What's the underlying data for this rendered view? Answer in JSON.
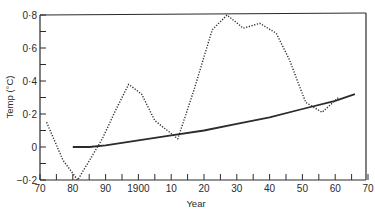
{
  "chart_data": {
    "type": "line",
    "title": "",
    "xlabel": "Year",
    "ylabel": "Temp (°C)",
    "xlim": [
      1870,
      1970
    ],
    "ylim": [
      -0.2,
      0.8
    ],
    "grid": false,
    "legend": null,
    "x_tick_labels": [
      {
        "year": 1870,
        "label": "70"
      },
      {
        "year": 1880,
        "label": "80"
      },
      {
        "year": 1890,
        "label": "90"
      },
      {
        "year": 1900,
        "label": "1900"
      },
      {
        "year": 1910,
        "label": "10"
      },
      {
        "year": 1920,
        "label": "20"
      },
      {
        "year": 1930,
        "label": "30"
      },
      {
        "year": 1940,
        "label": "40"
      },
      {
        "year": 1950,
        "label": "50"
      },
      {
        "year": 1960,
        "label": "60"
      },
      {
        "year": 1970,
        "label": "70"
      }
    ],
    "x_minor_ticks": [
      1875,
      1885,
      1895,
      1905,
      1915,
      1925,
      1935,
      1945,
      1955,
      1965
    ],
    "y_tick_labels": [
      {
        "value": 0.8,
        "label": "0·8"
      },
      {
        "value": 0.6,
        "label": "0·6"
      },
      {
        "value": 0.4,
        "label": "0·4"
      },
      {
        "value": 0.2,
        "label": "0·2"
      },
      {
        "value": 0.0,
        "label": "0"
      },
      {
        "value": -0.2,
        "label": "−0·2"
      }
    ],
    "y_minor_ticks": [
      0.7,
      0.5,
      0.3,
      0.1,
      -0.1
    ],
    "series": [
      {
        "name": "Observed temperature (dotted)",
        "style": "dotted",
        "x": [
          1872,
          1877,
          1881.5,
          1886,
          1889,
          1893,
          1897,
          1901,
          1905,
          1912,
          1917,
          1922.5,
          1927,
          1932,
          1937,
          1942,
          1946,
          1951,
          1956,
          1961
        ],
        "values": [
          0.15,
          -0.08,
          -0.2,
          -0.05,
          0.05,
          0.22,
          0.38,
          0.32,
          0.16,
          0.05,
          0.35,
          0.71,
          0.8,
          0.72,
          0.75,
          0.69,
          0.53,
          0.27,
          0.21,
          0.3
        ]
      },
      {
        "name": "Trend (solid)",
        "style": "solid",
        "x": [
          1880,
          1885,
          1890,
          1900,
          1910,
          1920,
          1930,
          1940,
          1950,
          1960,
          1966
        ],
        "values": [
          0.0,
          0.0,
          0.01,
          0.04,
          0.07,
          0.1,
          0.14,
          0.18,
          0.23,
          0.28,
          0.32
        ]
      }
    ]
  }
}
